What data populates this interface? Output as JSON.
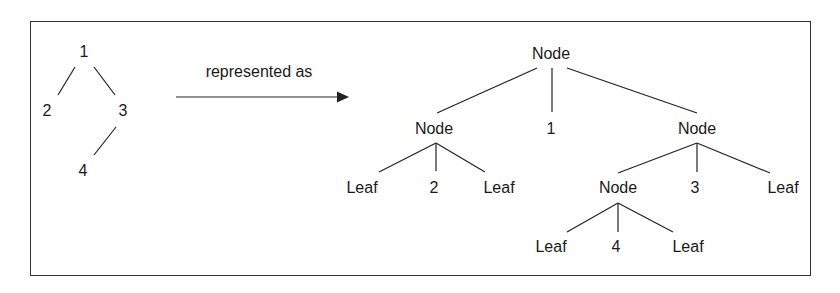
{
  "source_tree": {
    "nodes": [
      {
        "id": "n1",
        "label": "1",
        "x": 84,
        "y": 52
      },
      {
        "id": "n2",
        "label": "2",
        "x": 47,
        "y": 111
      },
      {
        "id": "n3",
        "label": "3",
        "x": 123,
        "y": 111
      },
      {
        "id": "n4",
        "label": "4",
        "x": 83,
        "y": 171
      }
    ]
  },
  "arrow": {
    "label": "represented as"
  },
  "represented_tree": {
    "nodes": [
      {
        "label": "Node",
        "x": 551,
        "y": 54
      },
      {
        "label": "Node",
        "x": 434,
        "y": 129
      },
      {
        "label": "1",
        "x": 551,
        "y": 129
      },
      {
        "label": "Node",
        "x": 697,
        "y": 129
      },
      {
        "label": "Leaf",
        "x": 362,
        "y": 188
      },
      {
        "label": "2",
        "x": 434,
        "y": 188
      },
      {
        "label": "Leaf",
        "x": 499,
        "y": 188
      },
      {
        "label": "Node",
        "x": 618,
        "y": 188
      },
      {
        "label": "3",
        "x": 695,
        "y": 188
      },
      {
        "label": "Leaf",
        "x": 783,
        "y": 188
      },
      {
        "label": "Leaf",
        "x": 551,
        "y": 247
      },
      {
        "label": "4",
        "x": 616,
        "y": 247
      },
      {
        "label": "Leaf",
        "x": 688,
        "y": 247
      }
    ]
  }
}
